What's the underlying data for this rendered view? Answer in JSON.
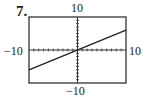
{
  "problem_number": "7.",
  "chart_data": {
    "type": "line",
    "title": "",
    "xlabel": "",
    "ylabel": "",
    "xlim": [
      -10,
      10
    ],
    "ylim": [
      -10,
      10
    ],
    "xscale_ticks": 1,
    "yscale_ticks": 1,
    "grid": false,
    "tick_labels": {
      "top": "10",
      "bottom": "-10",
      "left": "-10",
      "right": "10"
    },
    "series": [
      {
        "name": "line",
        "x": [
          -10,
          10
        ],
        "y": [
          -6,
          6
        ]
      }
    ]
  }
}
